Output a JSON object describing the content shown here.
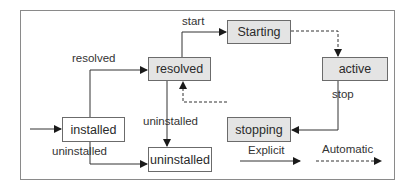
{
  "diagram": {
    "type": "state-transition",
    "nodes": {
      "installed": "installed",
      "resolved": "resolved",
      "starting": "Starting",
      "active": "active",
      "stopping": "stopping",
      "uninstalled": "uninstalled"
    },
    "edge_labels": {
      "resolved": "resolved",
      "start": "start",
      "stop": "stop",
      "uninstalled_from_resolved": "uninstalled",
      "uninstalled_from_installed": "uninstalled"
    },
    "legend": {
      "explicit": "Explicit",
      "automatic": "Automatic"
    },
    "edges": [
      {
        "from": "entry",
        "to": "installed",
        "style": "solid"
      },
      {
        "from": "installed",
        "to": "resolved",
        "label": "resolved",
        "style": "solid"
      },
      {
        "from": "resolved",
        "to": "starting",
        "label": "start",
        "style": "solid"
      },
      {
        "from": "starting",
        "to": "active",
        "style": "dashed"
      },
      {
        "from": "active",
        "to": "stopping",
        "label": "stop",
        "style": "solid"
      },
      {
        "from": "stopping",
        "to": "resolved",
        "style": "dashed"
      },
      {
        "from": "resolved",
        "to": "uninstalled",
        "label": "uninstalled",
        "style": "solid"
      },
      {
        "from": "installed",
        "to": "uninstalled",
        "label": "uninstalled",
        "style": "solid"
      }
    ],
    "colors": {
      "state_fill": "#e4e4e4",
      "terminal_fill": "#ffffff",
      "border": "#6b6b6b",
      "line": "#2a2a2a"
    }
  }
}
